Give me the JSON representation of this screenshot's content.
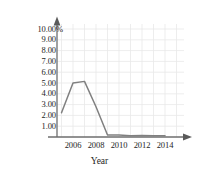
{
  "chart_data": {
    "type": "line",
    "title": "",
    "xlabel": "Year",
    "ylabel": "Annual Average Federal Funds Rate",
    "x": [
      2005,
      2006,
      2007,
      2008,
      2009,
      2010,
      2011,
      2012,
      2013,
      2014
    ],
    "values": [
      2.25,
      5.0,
      5.15,
      2.8,
      0.18,
      0.18,
      0.12,
      0.15,
      0.12,
      0.12
    ],
    "series": [
      {
        "name": "Annual Average Federal Funds Rate",
        "values": [
          2.25,
          5.0,
          5.15,
          2.8,
          0.18,
          0.18,
          0.12,
          0.15,
          0.12,
          0.12
        ]
      }
    ],
    "xlim": [
      2004.5,
      2015.2
    ],
    "ylim": [
      0,
      10.8
    ],
    "xticks": [
      2006,
      2008,
      2010,
      2012,
      2014
    ],
    "xtick_labels": [
      "2006",
      "2008",
      "2010",
      "2012",
      "2014"
    ],
    "yticks": [
      1,
      2,
      3,
      4,
      5,
      6,
      7,
      8,
      9,
      10
    ],
    "ytick_labels": [
      "1.00",
      "2.00",
      "3.00",
      "4.00",
      "5.00",
      "6.00",
      "7.00",
      "8.00",
      "9.00",
      "10.00%"
    ],
    "grid": true,
    "legend": "none",
    "line_color": "#808080",
    "grid_color": "#e8e8e8",
    "axis_color": "#6e6e6e",
    "background": "#ffffff"
  },
  "axes": {
    "y_title": "Annual Average Federal Funds Rate",
    "x_title": "Year",
    "y_labels": {
      "t10": "10.00%",
      "t9": "9.00",
      "t8": "8.00",
      "t7": "7.00",
      "t6": "6.00",
      "t5": "5.00",
      "t4": "4.00",
      "t3": "3.00",
      "t2": "2.00",
      "t1": "1.00"
    },
    "x_labels": {
      "t2006": "2006",
      "t2008": "2008",
      "t2010": "2010",
      "t2012": "2012",
      "t2014": "2014"
    }
  }
}
